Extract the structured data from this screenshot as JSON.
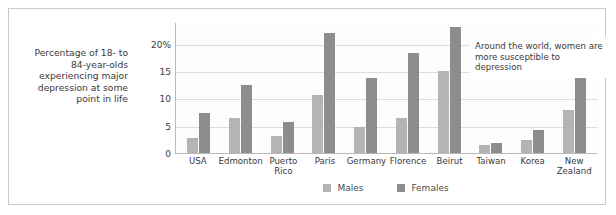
{
  "caption": "Percentage of 18- to 84-year-olds experiencing major depression at some point in life",
  "annotation": "Around the world, women are more susceptible to depression",
  "legend": {
    "males": "Males",
    "females": "Females"
  },
  "colors": {
    "males_bar": "#b4b4b4",
    "females_bar": "#8d8d8d",
    "gridline": "#dcdcdc",
    "axis": "#b9b9b9",
    "frame": "#cacaca",
    "text": "#3a3a3a"
  },
  "chart_data": {
    "type": "bar",
    "title": "",
    "subtitle": "",
    "xlabel": "",
    "ylabel": "Percentage of 18- to 84-year-olds experiencing major depression at some point in life",
    "categories": [
      "USA",
      "Edmonton",
      "Puerto Rico",
      "Paris",
      "Germany",
      "Florence",
      "Beirut",
      "Taiwan",
      "Korea",
      "New Zealand"
    ],
    "series": [
      {
        "name": "Males",
        "values": [
          2.8,
          6.5,
          3.2,
          10.7,
          4.8,
          6.4,
          15.0,
          1.5,
          2.3,
          7.8
        ]
      },
      {
        "name": "Females",
        "values": [
          7.4,
          12.5,
          5.7,
          22.0,
          13.8,
          18.3,
          23.0,
          1.8,
          4.3,
          15.8
        ]
      }
    ],
    "ylim": [
      0,
      24
    ],
    "yticks": [
      0,
      5,
      10,
      15,
      20
    ],
    "ytick_labels": [
      "0",
      "5",
      "10",
      "15",
      "20%"
    ],
    "grid": true,
    "legend_position": "bottom-center",
    "annotations": [
      "Around the world, women are more susceptible to depression"
    ]
  }
}
